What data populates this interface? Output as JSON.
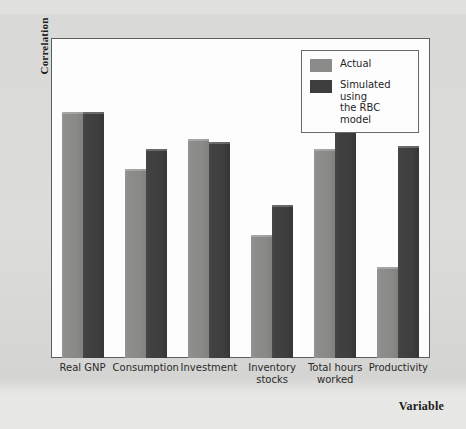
{
  "chart_data": {
    "type": "bar",
    "title": "",
    "xlabel": "Variable",
    "ylabel": "Correlation",
    "ylim": [
      0.0,
      1.05
    ],
    "yticks": [
      "0.0",
      "0.1",
      "0.2",
      "0.3",
      "0.4",
      "0.5",
      "0.6",
      "0.7",
      "0.8",
      "0.9",
      "1.0"
    ],
    "grid": false,
    "legend_position": "top-right",
    "categories": [
      "Real GNP",
      "Consumption",
      "Investment",
      "Inventory stocks",
      "Total hours worked",
      "Productivity"
    ],
    "category_lines": [
      [
        "Real GNP"
      ],
      [
        "Consumption"
      ],
      [
        "Investment"
      ],
      [
        "Inventory",
        "stocks"
      ],
      [
        "Total hours",
        "worked"
      ],
      [
        "Productivity"
      ]
    ],
    "series": [
      {
        "name": "Actual",
        "color": "#8b8b89",
        "values": [
          1.0,
          0.77,
          0.89,
          0.5,
          0.85,
          0.37
        ]
      },
      {
        "name": "Simulated using the RBC model",
        "color": "#3e3e3e",
        "values": [
          1.0,
          0.85,
          0.88,
          0.62,
          0.95,
          0.86
        ]
      }
    ]
  },
  "legend": {
    "entries": [
      {
        "label": "Actual",
        "color": "#8b8b89"
      },
      {
        "label": "Simulated using\nthe RBC model",
        "line1": "Simulated using",
        "line2": "the RBC model",
        "color": "#3e3e3e"
      }
    ]
  },
  "axes": {
    "y_title": "Correlation",
    "x_title": "Variable"
  },
  "colors": {
    "actual": "#8b8b89",
    "simulated": "#3e3e3e",
    "plot_background": "#fdfdfd",
    "page_background": "#d9d9d7",
    "axis_line": "#5d5d5d"
  }
}
